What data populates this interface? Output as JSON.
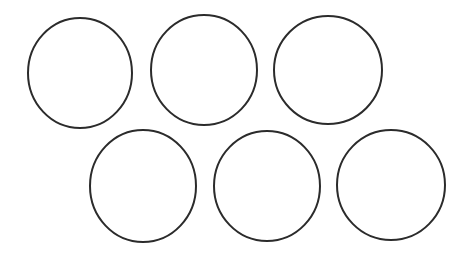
{
  "canvas": {
    "width": 461,
    "height": 269,
    "background_color": "#ffffff",
    "title": "Six Circles Diagram",
    "shape_count": 6,
    "row_count": 2,
    "columns_per_row": 3
  },
  "style": {
    "stroke_color": "#2b2b2b",
    "stroke_width": 2,
    "fill": "none",
    "fill_color": "#ffffff"
  },
  "shapes": [
    {
      "id": "circle-1",
      "label": "Circle 1",
      "row": 1,
      "column": 1,
      "cx": 80,
      "cy": 73,
      "rx": 52,
      "ry": 55,
      "bbox": {
        "left": 28,
        "top": 18,
        "right": 132,
        "bottom": 128
      }
    },
    {
      "id": "circle-2",
      "label": "Circle 2",
      "row": 1,
      "column": 2,
      "cx": 204,
      "cy": 70,
      "rx": 53,
      "ry": 55,
      "bbox": {
        "left": 151,
        "top": 15,
        "right": 257,
        "bottom": 125
      }
    },
    {
      "id": "circle-3",
      "label": "Circle 3",
      "row": 1,
      "column": 3,
      "cx": 328,
      "cy": 70,
      "rx": 54,
      "ry": 54,
      "bbox": {
        "left": 274,
        "top": 16,
        "right": 382,
        "bottom": 124
      }
    },
    {
      "id": "circle-4",
      "label": "Circle 4",
      "row": 2,
      "column": 1,
      "cx": 143,
      "cy": 186,
      "rx": 53,
      "ry": 56,
      "bbox": {
        "left": 90,
        "top": 130,
        "right": 196,
        "bottom": 242
      }
    },
    {
      "id": "circle-5",
      "label": "Circle 5",
      "row": 2,
      "column": 2,
      "cx": 267,
      "cy": 186,
      "rx": 53,
      "ry": 55,
      "bbox": {
        "left": 214,
        "top": 131,
        "right": 320,
        "bottom": 241
      }
    },
    {
      "id": "circle-6",
      "label": "Circle 6",
      "row": 2,
      "column": 3,
      "cx": 391,
      "cy": 185,
      "rx": 54,
      "ry": 55,
      "bbox": {
        "left": 337,
        "top": 130,
        "right": 445,
        "bottom": 240
      }
    }
  ]
}
